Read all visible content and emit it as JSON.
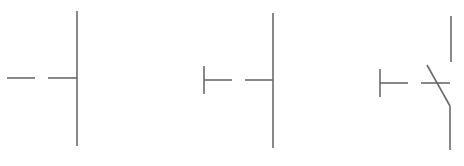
{
  "diagram": {
    "title": "",
    "stroke_color": "#6b6b6b",
    "background": "#ffffff",
    "symbols": [
      {
        "name": "open-contact-plain",
        "lead_left": {
          "x1": 7,
          "y1": 78,
          "x2": 35,
          "y2": 78
        },
        "lead_right": {
          "x1": 48,
          "y1": 78,
          "x2": 77,
          "y2": 78
        },
        "rail": {
          "x1": 77,
          "y1": 11,
          "x2": 77,
          "y2": 146
        }
      },
      {
        "name": "pushbutton-normally-open",
        "actuator_bar": {
          "x1": 204,
          "y1": 66,
          "x2": 204,
          "y2": 94
        },
        "lead_left": {
          "x1": 204,
          "y1": 80,
          "x2": 232,
          "y2": 80
        },
        "lead_right": {
          "x1": 245,
          "y1": 80,
          "x2": 273,
          "y2": 80
        },
        "rail": {
          "x1": 273,
          "y1": 13,
          "x2": 273,
          "y2": 148
        }
      },
      {
        "name": "pushbutton-normally-closed",
        "actuator_bar": {
          "x1": 380,
          "y1": 69,
          "x2": 380,
          "y2": 97
        },
        "lead_left": {
          "x1": 380,
          "y1": 83,
          "x2": 408,
          "y2": 83
        },
        "crossbar": {
          "x1": 421,
          "y1": 83,
          "x2": 450,
          "y2": 83
        },
        "rail_top": {
          "x1": 451,
          "y1": 16,
          "x2": 451,
          "y2": 62
        },
        "blade": {
          "x1": 427,
          "y1": 65,
          "x2": 450,
          "y2": 106
        },
        "rail_bottom": {
          "x1": 450,
          "y1": 106,
          "x2": 450,
          "y2": 150
        }
      }
    ]
  }
}
